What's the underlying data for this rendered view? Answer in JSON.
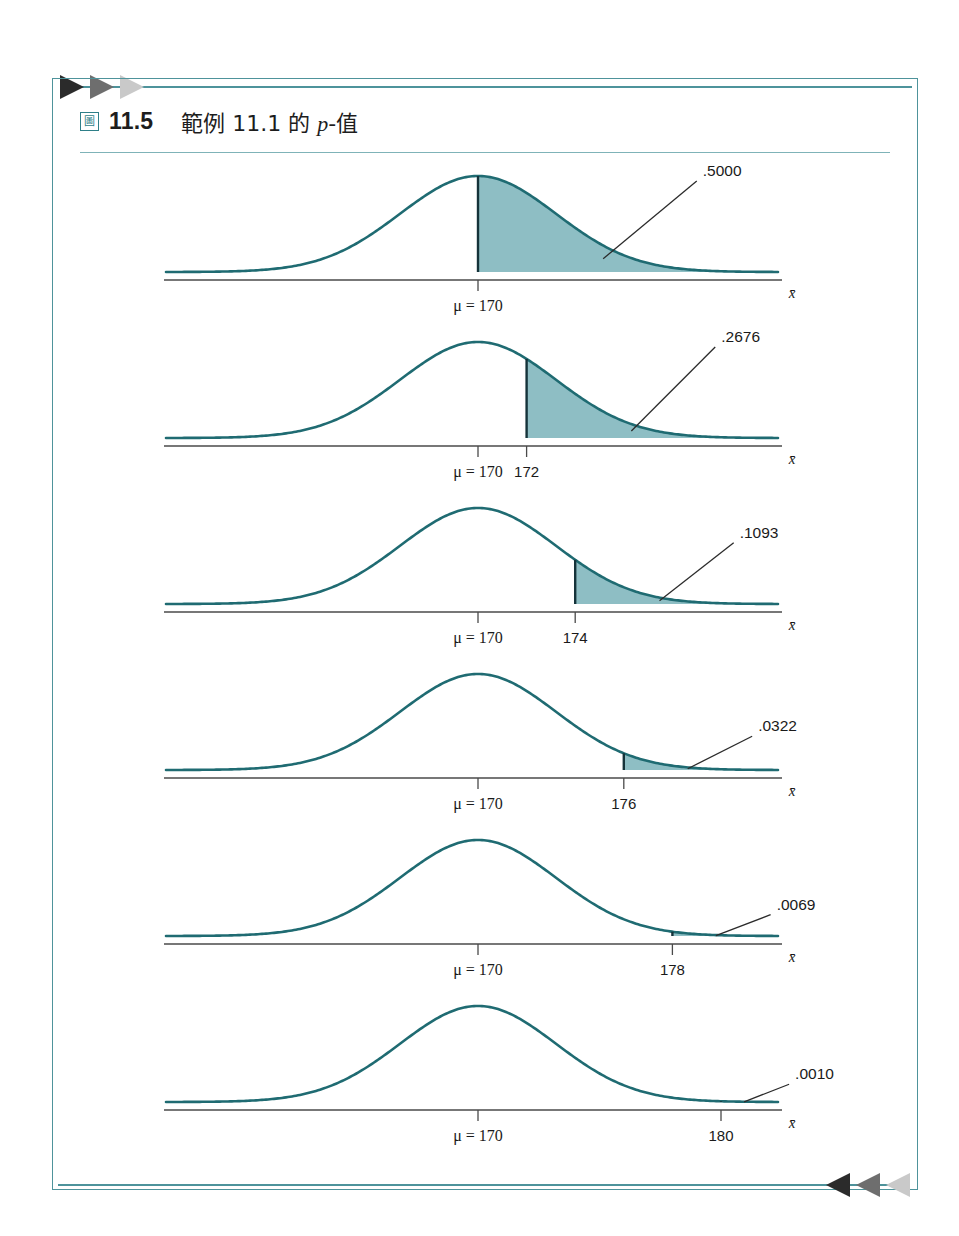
{
  "figure": {
    "glyph": "圖",
    "number": "11.5",
    "caption_pre": "範例 11.1 的 ",
    "caption_italic": "p",
    "caption_post": "-值",
    "caption_full": "範例 11.1 的 p-值"
  },
  "colors": {
    "frame": "#4e939b",
    "rule": "#7fb3b8",
    "curve": "#1f6b72",
    "fill": "#8ebec4",
    "axis": "#4a4a4a",
    "text": "#1a1a1a",
    "arrow_dark": "#2b2b2b",
    "arrow_mid": "#6e6e6e",
    "arrow_light": "#c9c9c9"
  },
  "axis": {
    "name": "x̄",
    "mu_label": "μ = 170",
    "mu_value": 170
  },
  "chart_data": {
    "type": "area",
    "title": "範例 11.1 的 p-值",
    "xlabel": "x̄",
    "ylabel": "",
    "grid": false,
    "legend": "none",
    "panels": [
      {
        "id": 1,
        "mu": 170,
        "cutoff": 170,
        "cutoff_label": "",
        "area": ".5000",
        "area_value": 0.5
      },
      {
        "id": 2,
        "mu": 170,
        "cutoff": 172,
        "cutoff_label": "172",
        "area": ".2676",
        "area_value": 0.2676
      },
      {
        "id": 3,
        "mu": 170,
        "cutoff": 174,
        "cutoff_label": "174",
        "area": ".1093",
        "area_value": 0.1093
      },
      {
        "id": 4,
        "mu": 170,
        "cutoff": 176,
        "cutoff_label": "176",
        "area": ".0322",
        "area_value": 0.0322
      },
      {
        "id": 5,
        "mu": 170,
        "cutoff": 178,
        "cutoff_label": "178",
        "area": ".0069",
        "area_value": 0.0069
      },
      {
        "id": 6,
        "mu": 170,
        "cutoff": 180,
        "cutoff_label": "180",
        "area": ".0010",
        "area_value": 0.001
      }
    ],
    "sigma_xbar": 3.23,
    "x_axis_units_per_px": 0.0417
  },
  "arrows": {
    "top": [
      "dark",
      "mid",
      "light"
    ],
    "bottom": [
      "light",
      "mid",
      "dark"
    ]
  }
}
